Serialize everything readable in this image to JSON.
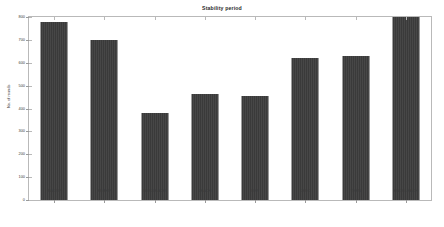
{
  "chart_data": {
    "type": "bar",
    "title": "Stability period",
    "xlabel": "",
    "ylabel": "No. of rounds",
    "categories": [
      "IEACRP",
      "EEAHP",
      "MODLEACH",
      "LEACH",
      "REP",
      "DEEC",
      "TEEN",
      "ENODLEACH"
    ],
    "values": [
      780,
      700,
      380,
      465,
      455,
      620,
      630,
      800
    ],
    "ylim": [
      0,
      800
    ],
    "ytick_labels": [
      "0",
      "100",
      "200",
      "300",
      "400",
      "500",
      "600",
      "700",
      "800"
    ],
    "ytick_values": [
      0,
      100,
      200,
      300,
      400,
      500,
      600,
      700,
      800
    ],
    "grid": false,
    "legend": "none",
    "bar_color": "#3d3d3d",
    "axes_color": "#b9b9b9",
    "background_color": "#ffffff"
  }
}
